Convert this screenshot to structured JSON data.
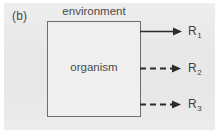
{
  "figure": {
    "panel_label": "(b)",
    "environment_label": "environment",
    "organism_label": "organism",
    "outputs": [
      {
        "base": "R",
        "subscript": "1",
        "line_style": "solid",
        "name": "output-r1"
      },
      {
        "base": "R",
        "subscript": "2",
        "line_style": "dashed",
        "name": "output-r2"
      },
      {
        "base": "R",
        "subscript": "3",
        "line_style": "dashed",
        "name": "output-r3"
      }
    ],
    "colors": {
      "background": "#e7e7e7",
      "box_fill": "#efefef",
      "box_stroke": "#6e6e6e",
      "text": "#4a4a4a",
      "arrow": "#2b2b2b"
    }
  }
}
